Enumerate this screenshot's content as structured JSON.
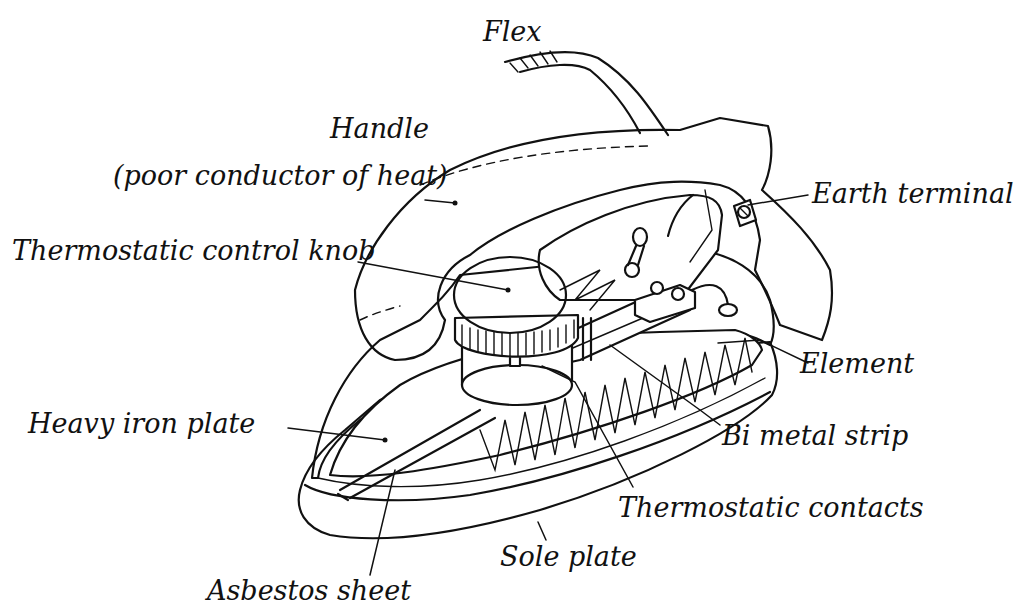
{
  "diagram": {
    "labels": {
      "flex": "Flex",
      "handle_line1": "Handle",
      "handle_line2": "(poor conductor of heat)",
      "knob": "Thermostatic control knob",
      "earth": "Earth terminal",
      "element": "Element",
      "bimetal": "Bi metal strip",
      "iron_plate": "Heavy iron plate",
      "contacts": "Thermostatic contacts",
      "sole_plate": "Sole plate",
      "asbestos": "Asbestos sheet"
    },
    "colors": {
      "ink": "#111111",
      "background": "#ffffff"
    }
  }
}
